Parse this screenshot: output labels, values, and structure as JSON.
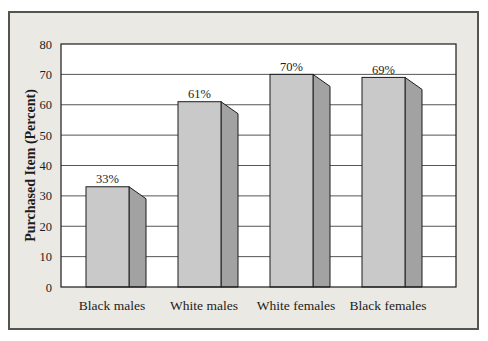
{
  "chart_data": {
    "type": "bar",
    "title": "",
    "xlabel": "",
    "ylabel": "Purchased Item (Percent)",
    "categories": [
      "Black males",
      "White males",
      "White females",
      "Black females"
    ],
    "values": [
      33,
      61,
      70,
      69
    ],
    "data_labels": [
      "33%",
      "61%",
      "70%",
      "69%"
    ],
    "ylim": [
      0,
      80
    ],
    "yticks": [
      0,
      10,
      20,
      30,
      40,
      50,
      60,
      70,
      80
    ],
    "grid": "horizontal",
    "legend": "none",
    "bar_style": "3d-extruded-gray"
  },
  "colors": {
    "frame_background": "#ebe9e3",
    "frame_border": "#56544f",
    "plot_background": "#ffffff",
    "grid_line": "#2b2b2b",
    "plot_border": "#1c1c1c",
    "bar_front": "#c9c9c9",
    "bar_side": "#a2a2a2",
    "bar_outline": "#1c1c1c",
    "text": "#1c1c1c"
  }
}
